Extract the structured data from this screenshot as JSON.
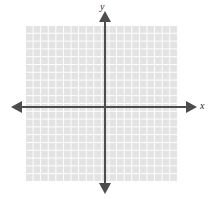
{
  "figure": {
    "type": "blank-cartesian-grid",
    "background_color": "#ffffff",
    "axis_color": "#4d4d4d",
    "grid_cell_color": "#e3e3e3",
    "grid_line_color": "#ffffff",
    "label_color": "#2e2e2e"
  },
  "axes": {
    "x_label": "x",
    "y_label": "y"
  },
  "chart_data": {
    "type": "scatter",
    "title": "",
    "subtitle": "",
    "xlabel": "x",
    "ylabel": "y",
    "series": [],
    "x": [],
    "values": [],
    "annotations": [],
    "legend": [],
    "legend_position": "none",
    "grid": true,
    "grid_columns": 20,
    "grid_rows": 20,
    "xlim": [
      -10,
      10
    ],
    "ylim": [
      -10,
      10
    ],
    "xticklabels": [],
    "yticklabels": [],
    "origin_shown": true,
    "arrowheads": [
      "left",
      "right",
      "up",
      "down"
    ]
  }
}
